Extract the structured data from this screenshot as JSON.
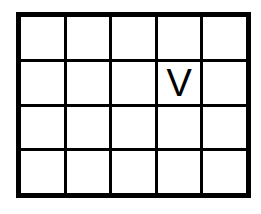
{
  "grid": {
    "rows": 4,
    "cols": 5,
    "cells": [
      [
        "",
        "",
        "",
        "",
        ""
      ],
      [
        "",
        "",
        "",
        "V",
        ""
      ],
      [
        "",
        "",
        "",
        "",
        ""
      ],
      [
        "",
        "",
        "",
        "",
        ""
      ]
    ]
  },
  "colors": {
    "line": "#000000",
    "background": "#ffffff",
    "text": "#000000"
  }
}
